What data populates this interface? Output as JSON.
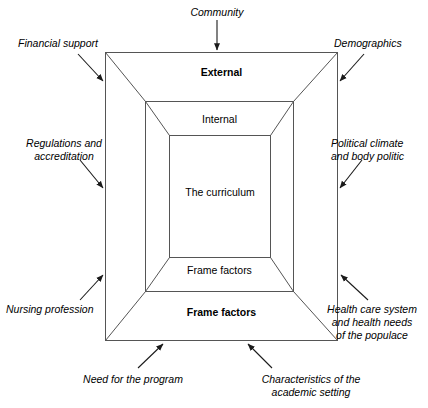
{
  "diagram": {
    "stroke_color": "#444444",
    "text_color": "#000000",
    "background": "#ffffff",
    "nested_boxes": [
      {
        "key": "external",
        "label": "External",
        "emphasis": "bold"
      },
      {
        "key": "internal",
        "label": "Internal",
        "emphasis": "normal"
      },
      {
        "key": "curriculum",
        "label": "The curriculum",
        "emphasis": "normal"
      },
      {
        "key": "frame_inner",
        "label": "Frame factors",
        "emphasis": "normal"
      },
      {
        "key": "frame_outer",
        "label": "Frame factors",
        "emphasis": "bold"
      }
    ],
    "external_factors": [
      {
        "key": "community",
        "label": "Community"
      },
      {
        "key": "financial_support",
        "label": "Financial support"
      },
      {
        "key": "demographics",
        "label": "Demographics"
      },
      {
        "key": "regulations",
        "label": "Regulations and\naccreditation"
      },
      {
        "key": "political_climate",
        "label": "Political climate\nand body politic"
      },
      {
        "key": "nursing_profession",
        "label": "Nursing profession"
      },
      {
        "key": "health_care_system",
        "label": "Health care system\nand health needs\nof the populace"
      },
      {
        "key": "need_for_program",
        "label": "Need for the program"
      },
      {
        "key": "academic_setting",
        "label": "Characteristics of the\nacademic setting"
      }
    ]
  }
}
